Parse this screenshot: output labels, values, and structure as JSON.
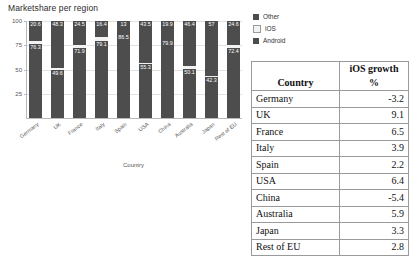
{
  "chart_data": {
    "type": "bar",
    "subtype": "stacked-100",
    "title": "Marketshare per region",
    "xlabel": "Country",
    "ylabel": "",
    "ylim": [
      0,
      100
    ],
    "yticks": [
      100,
      75,
      50,
      25
    ],
    "grid": true,
    "legend_position": "right",
    "legend": [
      "Other",
      "iOS",
      "Android"
    ],
    "colors": {
      "Other": "#4d4d4d",
      "iOS": "#f2f2f2",
      "Android": "#4d4d4d"
    },
    "categories": [
      "Germany",
      "UK",
      "France",
      "Italy",
      "Spain",
      "USA",
      "China",
      "Australia",
      "Japan",
      "Rest of EU"
    ],
    "series": [
      {
        "name": "Other",
        "values": [
          20.6,
          48.3,
          24.5,
          16.4,
          13,
          43.5,
          19.9,
          46.4,
          57,
          24.6
        ]
      },
      {
        "name": "iOS",
        "values": [
          3.1,
          2.1,
          3.6,
          4.5,
          0.5,
          1.2,
          0.2,
          3.5,
          0.7,
          3.0
        ]
      },
      {
        "name": "Android",
        "values": [
          76.3,
          49.6,
          71.9,
          79.1,
          86.5,
          55.3,
          79.9,
          50.1,
          42.3,
          72.4
        ]
      }
    ],
    "bar_labels": {
      "Other": [
        "20.6",
        "48.3",
        "24.5",
        "16.4",
        "13",
        "43.5",
        "19.9",
        "46.4",
        "57",
        "24.6"
      ],
      "Android": [
        "76.3",
        "49.6",
        "71.9",
        "79.1",
        "86.5",
        "55.3",
        "79.9",
        "50.1",
        "42.3",
        "72.4"
      ]
    }
  },
  "table": {
    "headers": {
      "country": "Country",
      "growth_line1": "iOS growth",
      "growth_line2": "%"
    },
    "rows": [
      {
        "country": "Germany",
        "growth": "-3.2"
      },
      {
        "country": "UK",
        "growth": "9.1"
      },
      {
        "country": "France",
        "growth": "6.5"
      },
      {
        "country": "Italy",
        "growth": "3.9"
      },
      {
        "country": "Spain",
        "growth": "2.2"
      },
      {
        "country": "USA",
        "growth": "6.4"
      },
      {
        "country": "China",
        "growth": "-5.4"
      },
      {
        "country": "Australia",
        "growth": "5.9"
      },
      {
        "country": "Japan",
        "growth": "3.3"
      },
      {
        "country": "Rest of EU",
        "growth": "2.8"
      }
    ]
  }
}
